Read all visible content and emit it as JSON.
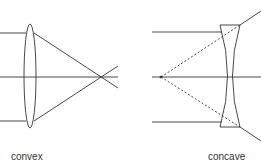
{
  "diagram": {
    "convex": {
      "label": "convex"
    },
    "concave": {
      "label": "concave"
    },
    "colors": {
      "line": "#333333",
      "background": "#ffffff"
    }
  }
}
